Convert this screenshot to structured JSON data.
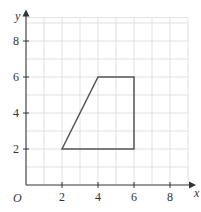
{
  "diagram": {
    "type": "coordinate-grid",
    "origin_label": "O",
    "x_axis": {
      "label": "x",
      "min": 0,
      "max": 9,
      "ticks": [
        2,
        4,
        6,
        8
      ],
      "tick_labels": [
        "2",
        "4",
        "6",
        "8"
      ]
    },
    "y_axis": {
      "label": "y",
      "min": 0,
      "max": 9.3,
      "ticks": [
        2,
        4,
        6,
        8
      ],
      "tick_labels": [
        "2",
        "4",
        "6",
        "8"
      ]
    },
    "grid": {
      "step": 1,
      "color": "#d9d9d9"
    },
    "shape": {
      "name": "trapezium",
      "vertices": [
        [
          2,
          2
        ],
        [
          4,
          6
        ],
        [
          6,
          6
        ],
        [
          6,
          2
        ]
      ],
      "stroke": "#555555"
    }
  }
}
